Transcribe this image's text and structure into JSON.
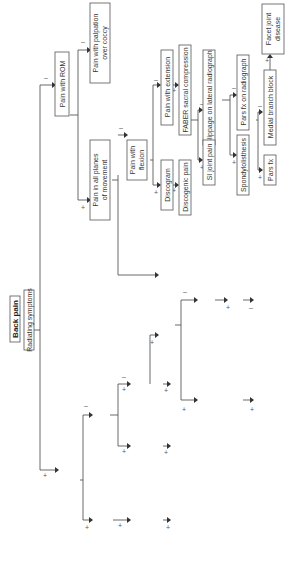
{
  "diagram": {
    "title": "Back pain",
    "colors": {
      "stroke": "#555555",
      "text": "#333333",
      "background": "#ffffff"
    },
    "nodes": {
      "back_pain": "Back pain",
      "radiating": "Radiating symptoms",
      "both_legs": [
        "Radiating symptoms",
        "into both legs"
      ],
      "worse_walking": [
        "Symptoms worse",
        "with walking"
      ],
      "better_sitting": [
        "Symptoms",
        "better with sitting"
      ],
      "spinal_stenosis": "Spinal stenosis",
      "slr": [
        "Straight leg",
        "raise"
      ],
      "fair": [
        "FAIR,",
        "Pace maneuver"
      ],
      "piriformis": [
        "Piriformis",
        "syndrome"
      ],
      "slump": "Slump test",
      "lumbar_rad": [
        "Lumbar",
        "radiculopathy"
      ],
      "rom_gradual": [
        "↓ ROM",
        "gradual"
      ],
      "acute_spasm": [
        "Acute",
        "spasm"
      ],
      "radiograph": "Radiograph",
      "lumbar_strain": "Lumbar strain/sprain",
      "radiograph_si": [
        "Radiograph",
        "shows + blurring",
        "of SI joint line"
      ],
      "ankylosing": "Ankylosing spondylitis",
      "pain_rom": "Pain with ROM",
      "pain_palpation": [
        "Pain with palpation",
        "over coccy"
      ],
      "coccydynia": "Coccycodynia",
      "all_planes": [
        "Pain in all planes",
        "of movement"
      ],
      "pain_flexion": [
        "Pain with",
        "flexion"
      ],
      "discogram": "Discogram",
      "discogenic": "Discogenic pain",
      "pain_extension": "Pain with extension",
      "faber": "FABER sacral compression",
      "si_joint": "SI joint pain",
      "slippage": "Slippage on lateral radiograph",
      "spondylolisthesis": "Spondylolisthesis",
      "pars_radiograph": "Pars fx on radiograph",
      "pars_fx": "Pars fx",
      "medial_branch": "Medial branch block",
      "facet": [
        "Facet joint",
        "disease"
      ]
    },
    "signs": {
      "plus": "+",
      "minus": "–"
    }
  }
}
